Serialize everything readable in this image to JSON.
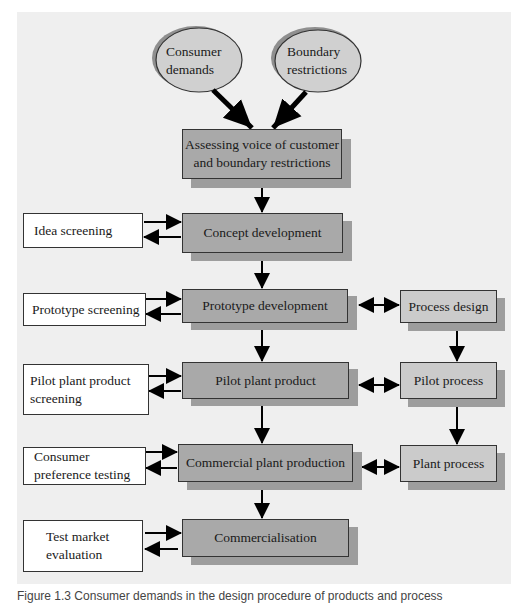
{
  "figure": {
    "inputs": [
      {
        "label_line1": "Consumer",
        "label_line2": "demands"
      },
      {
        "label_line1": "Boundary",
        "label_line2": "restrictions"
      }
    ],
    "assess": {
      "line1": "Assessing voice of customer",
      "line2": "and boundary restrictions"
    },
    "main_stages": [
      "Concept development",
      "Prototype development",
      "Pilot plant product",
      "Commercial plant production",
      "Commercialisation"
    ],
    "screening": [
      {
        "line1": "Idea screening",
        "line2": ""
      },
      {
        "line1": "Prototype screening",
        "line2": ""
      },
      {
        "line1": "Pilot plant product",
        "line2": "screening"
      },
      {
        "line1": "Consumer",
        "line2": "preference testing"
      },
      {
        "line1": "Test market",
        "line2": "evaluation"
      }
    ],
    "process": [
      "Process design",
      "Pilot process",
      "Plant process"
    ],
    "caption": "Figure 1.3  Consumer demands in the design procedure of products and process"
  },
  "colors": {
    "panel": "#efefef",
    "main_box": "#a9a9a9",
    "process_box": "#cbcbcb",
    "screen_box": "#ffffff",
    "shadow": "#9d9d9d",
    "ellipse": "#d0d0d0",
    "arrow": "#000000"
  }
}
